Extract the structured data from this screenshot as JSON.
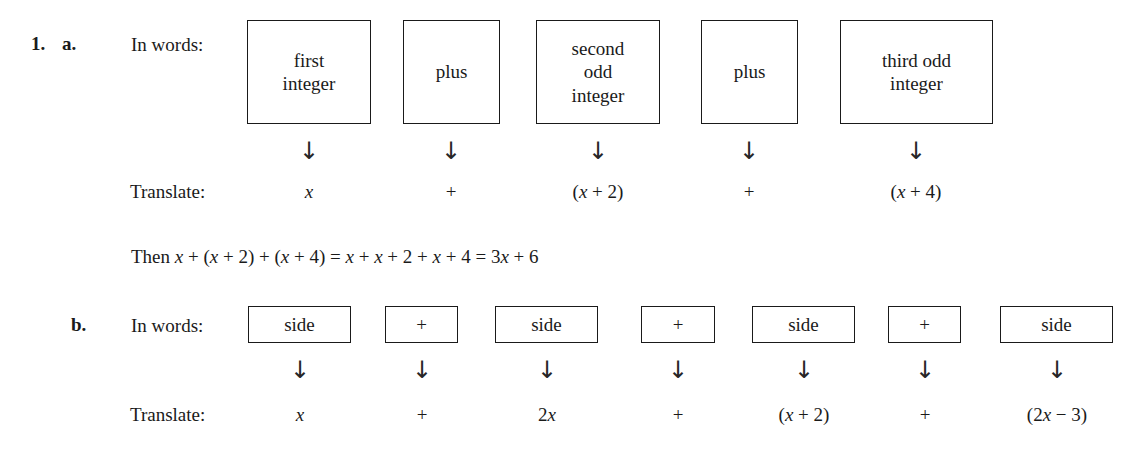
{
  "problem": {
    "number": "1.",
    "parts": [
      {
        "label": "a.",
        "in_words_label": "In words:",
        "translate_label": "Translate:",
        "boxes": [
          {
            "lines": [
              "first",
              "integer"
            ]
          },
          {
            "lines": [
              "plus"
            ]
          },
          {
            "lines": [
              "second",
              "odd",
              "integer"
            ]
          },
          {
            "lines": [
              "plus"
            ]
          },
          {
            "lines": [
              "third odd",
              "integer"
            ]
          }
        ],
        "arrow_glyph": "↓",
        "translations": [
          "x",
          "+",
          "(x + 2)",
          "+",
          "(x + 4)"
        ],
        "conclusion": "Then x + (x + 2) + (x + 4) = x + x + 2 + x + 4 = 3x + 6"
      },
      {
        "label": "b.",
        "in_words_label": "In words:",
        "translate_label": "Translate:",
        "boxes": [
          {
            "lines": [
              "side"
            ]
          },
          {
            "lines": [
              "+"
            ]
          },
          {
            "lines": [
              "side"
            ]
          },
          {
            "lines": [
              "+"
            ]
          },
          {
            "lines": [
              "side"
            ]
          },
          {
            "lines": [
              "+"
            ]
          },
          {
            "lines": [
              "side"
            ]
          }
        ],
        "arrow_glyph": "↓",
        "translations": [
          "x",
          "+",
          "2x",
          "+",
          "(x + 2)",
          "+",
          "(2x − 3)"
        ]
      }
    ]
  },
  "colors": {
    "ink": "#1a1a1a",
    "page": "#ffffff",
    "box_border": "#1a1a1a"
  }
}
